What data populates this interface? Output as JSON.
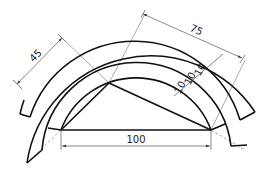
{
  "diagram": {
    "type": "technical-drawing",
    "colors": {
      "stroke": "#111111",
      "dimension": "#555555",
      "construction": "#888888",
      "background": "#ffffff"
    },
    "dimensions": {
      "base": "100",
      "left_side": "45",
      "right_arc": "75",
      "band_spacing_1": "10",
      "band_spacing_2": "10",
      "band_spacing_3": "10"
    }
  }
}
